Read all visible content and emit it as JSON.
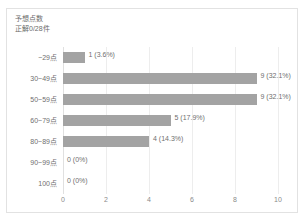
{
  "card": {
    "title": "予想点数",
    "subtitle": "正解0/28件"
  },
  "chart_data": {
    "type": "bar",
    "orientation": "horizontal",
    "title": "予想点数",
    "subtitle": "正解0/28件",
    "xlabel": "",
    "ylabel": "",
    "xlim": [
      0,
      10
    ],
    "xticks": [
      "0",
      "2",
      "4",
      "6",
      "8",
      "10"
    ],
    "xtick_values": [
      0,
      2,
      4,
      6,
      8,
      10
    ],
    "grid": true,
    "grid_axis": "x",
    "legend": false,
    "bar_color": "#a3a3a3",
    "label_color": "#6f6f6f",
    "categories": [
      "~29点",
      "30~49点",
      "50~59点",
      "60~79点",
      "80~89点",
      "90~99点",
      "100点"
    ],
    "values": [
      1,
      9,
      9,
      5,
      4,
      0,
      0
    ],
    "percents": [
      "3.6%",
      "32.1%",
      "32.1%",
      "17.9%",
      "14.3%",
      "0%",
      "0%"
    ],
    "data_labels": [
      "1 (3.6%)",
      "9 (32.1%)",
      "9 (32.1%)",
      "5 (17.9%)",
      "4 (14.3%)",
      "0 (0%)",
      "0 (0%)"
    ],
    "total": 28
  }
}
